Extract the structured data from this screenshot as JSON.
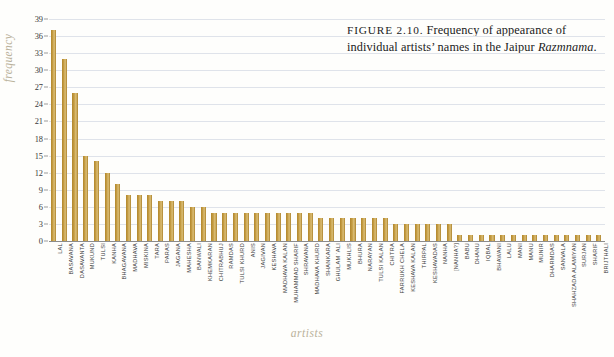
{
  "caption": {
    "figure_label": "FIGURE 2.10.",
    "text_line1": "Frequency",
    "text_line2": "of appearance of individual",
    "text_line3": "artists’ names in the Jaipur",
    "title_italic": "Razmnama",
    "period": "."
  },
  "colors": {
    "bar": "#c39a3f",
    "gridline": "#dfe3ea",
    "axis": "#8c8c8c",
    "axis_title": "#b9b19a",
    "text": "#3c3c3c"
  },
  "chart_data": {
    "type": "bar",
    "title": "Frequency of appearance of individual artists’ names in the Jaipur Razmnama",
    "xlabel": "artists",
    "ylabel": "frequency",
    "ylim": [
      0,
      39
    ],
    "yticks": [
      0,
      3,
      6,
      9,
      12,
      15,
      18,
      21,
      24,
      27,
      30,
      33,
      36,
      39
    ],
    "grid": true,
    "legend": "none",
    "categories": [
      "LAL",
      "BASAVANA",
      "DASAVANTA",
      "MUKUND",
      "TULSI",
      "KANHA",
      "BHAGAVANA",
      "MADHAVA",
      "MISKINA",
      "TARA",
      "PARAS",
      "JAGANA",
      "MAHESHA",
      "BANWALI",
      "KHEMKARAN",
      "CHITRABHUJ",
      "RAMDAS",
      "TULSI KHURD",
      "ANIS",
      "JAGIVAN",
      "KESHAVA",
      "MADHAVA KALAN",
      "MUHAMMAD SHARIF",
      "SHRAVANA",
      "MADHAVA KHURD",
      "SHANKARA",
      "GHULAM ‘ALI",
      "MUKHLIS",
      "BHURA",
      "NARAYAN",
      "TULSI KALAN",
      "CHITRA",
      "FARRUKH CHELA",
      "KESHAVA KALAN",
      "THIRPAL",
      "KESHAVADAS",
      "NANHA",
      "[NANHA?]",
      "BABU",
      "DHANU",
      "IQBAL",
      "BHAWANI",
      "LALU",
      "MANI",
      "MANU",
      "MUNIR",
      "DHARMDAS",
      "SANVALA",
      "SHAHZADA ALAMIYAN",
      "SURJAN",
      "SHARIF",
      "BRIJTHALI"
    ],
    "values": [
      37,
      32,
      26,
      15,
      14,
      12,
      10,
      8,
      8,
      8,
      7,
      7,
      7,
      6,
      6,
      5,
      5,
      5,
      5,
      5,
      5,
      5,
      5,
      5,
      5,
      4,
      4,
      4,
      4,
      4,
      4,
      4,
      3,
      3,
      3,
      3,
      3,
      3,
      1,
      1,
      1,
      1,
      1,
      1,
      1,
      1,
      1,
      1,
      1,
      1,
      1,
      1
    ]
  }
}
